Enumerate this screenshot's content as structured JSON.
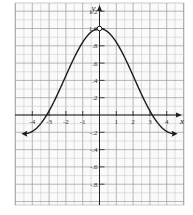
{
  "chart_data": {
    "type": "line",
    "title": "",
    "xlabel": "x",
    "ylabel": "y",
    "function": "y = sin(x)/x",
    "xlim": [
      -4.95,
      4.95
    ],
    "ylim": [
      -1.05,
      1.3
    ],
    "grid": true,
    "minor_grid": {
      "x_step": 0.5,
      "y_step": 0.1
    },
    "x_ticks": [
      -4,
      -3,
      -2,
      -1,
      1,
      2,
      3,
      4
    ],
    "x_tick_labels": [
      "-4",
      "-3",
      "-2",
      "-1",
      "1",
      "2",
      "3",
      "4"
    ],
    "y_ticks": [
      -0.8,
      -0.6,
      -0.4,
      -0.2,
      0.2,
      0.4,
      0.6,
      0.8,
      1.0,
      1.2
    ],
    "y_tick_labels": [
      "-.8",
      "-.6",
      "-.4",
      "-.2",
      ".2",
      ".4",
      ".6",
      ".8",
      "1.0",
      "1.2"
    ],
    "open_point": {
      "x": 0,
      "y": 1.0
    },
    "arrows_at_ends": true,
    "x": [
      -4.5,
      -4.0,
      -3.5,
      -3.14,
      -3.0,
      -2.5,
      -2.0,
      -1.5,
      -1.0,
      -0.5,
      0,
      0.5,
      1.0,
      1.5,
      2.0,
      2.5,
      3.0,
      3.14,
      3.5,
      4.0,
      4.5
    ],
    "series": [
      {
        "name": "sin(x)/x",
        "values": [
          -0.217,
          -0.189,
          -0.1,
          0.0,
          0.047,
          0.239,
          0.455,
          0.665,
          0.841,
          0.959,
          1.0,
          0.959,
          0.841,
          0.665,
          0.455,
          0.239,
          0.047,
          0.0,
          -0.1,
          -0.189,
          -0.217
        ]
      }
    ]
  },
  "labels": {
    "x_axis": "x",
    "y_axis": "y"
  }
}
